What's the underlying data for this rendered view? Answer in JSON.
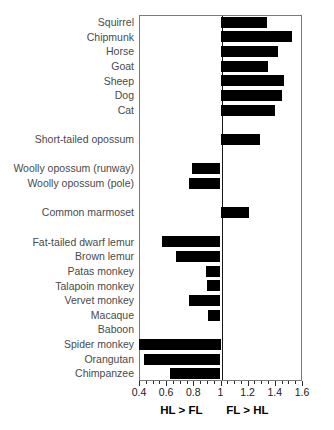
{
  "chart_data": {
    "type": "bar",
    "orientation": "horizontal",
    "title": "",
    "xlabel_left": "HL > FL",
    "xlabel_right": "FL > HL",
    "ylabel": "",
    "xlim": [
      0.4,
      1.6
    ],
    "baseline": 1.0,
    "grid": false,
    "legend": null,
    "xticks": [
      0.4,
      0.6,
      0.8,
      1.0,
      1.2,
      1.4,
      1.6
    ],
    "xticklabels": [
      "0.4",
      "0.6",
      "0.8",
      "1",
      "1.2",
      "1.4",
      "1.6"
    ],
    "minor_tick_step": 0.05,
    "bar_color": "#000000",
    "frame_color": "#7a7a7a",
    "label_color": "#4a4a4a",
    "categories": [
      "Squirrel",
      "Chipmunk",
      "Horse",
      "Goat",
      "Sheep",
      "Dog",
      "Cat",
      "",
      "Short-tailed opossum",
      "",
      "Woolly opossum (runway)",
      "Woolly opossum (pole)",
      "",
      "Common marmoset",
      "",
      "Fat-tailed dwarf lemur",
      "Brown lemur",
      "Patas monkey",
      "Talapoin monkey",
      "Vervet monkey",
      "Macaque",
      "Baboon",
      "Spider monkey",
      "Orangutan",
      "Chimpanzee"
    ],
    "values": [
      1.34,
      1.53,
      1.42,
      1.35,
      1.47,
      1.45,
      1.4,
      null,
      1.29,
      null,
      0.79,
      0.77,
      null,
      1.21,
      null,
      0.57,
      0.67,
      0.89,
      0.9,
      0.77,
      0.91,
      1.0,
      0.4,
      0.44,
      0.63
    ]
  }
}
